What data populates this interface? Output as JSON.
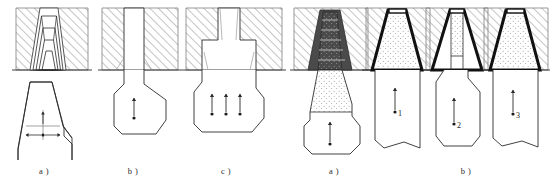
{
  "groups": [
    {
      "name": "left-group",
      "figures": [
        {
          "id": "left-a",
          "caption": "a )",
          "caption_x": 44,
          "caption_y": 172,
          "description": "stepped nested trapezoidal die cavity with hatched die body and billet below carrying crosshair dimension marker",
          "die_type": "stepped-cavity",
          "cavity_steps": 5,
          "fill": "none",
          "outline_weight": "thin",
          "arrows": [
            {
              "name": "vertical-dimension-arrow",
              "direction": "up",
              "label": ""
            },
            {
              "name": "horizontal-dimension-arrow-left",
              "direction": "left",
              "label": ""
            },
            {
              "name": "horizontal-dimension-arrow-right",
              "direction": "right",
              "label": ""
            }
          ],
          "marker": "crosshair"
        },
        {
          "id": "left-b",
          "caption": "b )",
          "caption_x": 133,
          "caption_y": 172,
          "description": "straight parallel die channel with hatched die body and flared billet below with single upward arrow",
          "die_type": "straight-channel",
          "cavity_steps": 0,
          "fill": "none",
          "outline_weight": "thin",
          "arrows": [
            {
              "name": "flow-arrow",
              "direction": "up",
              "label": ""
            }
          ],
          "marker": "dot"
        },
        {
          "id": "left-c",
          "caption": "c )",
          "caption_x": 226,
          "caption_y": 172,
          "description": "stepped shoulder die with hatched body and wide billet below with three upward flow arrows",
          "die_type": "stepped-shoulder",
          "cavity_steps": 2,
          "fill": "none",
          "outline_weight": "thin",
          "arrows": [
            {
              "name": "flow-arrow-left",
              "direction": "up",
              "label": ""
            },
            {
              "name": "flow-arrow-center",
              "direction": "up",
              "label": ""
            },
            {
              "name": "flow-arrow-right",
              "direction": "up",
              "label": ""
            }
          ],
          "marker": "dot"
        }
      ]
    },
    {
      "name": "right-group",
      "figures": [
        {
          "id": "right-a",
          "caption": "a )",
          "caption_x": 334,
          "caption_y": 172,
          "description": "stepped conical die cavity with dark step shading and stippled dead-metal zone, billet below with upward arrow",
          "die_type": "stepped-conical",
          "cavity_steps": 6,
          "fill": "stipple",
          "outline_weight": "thin",
          "arrows": [
            {
              "name": "flow-arrow",
              "direction": "up",
              "label": ""
            }
          ],
          "marker": "dot"
        },
        {
          "id": "right-b1",
          "caption": "",
          "caption_x": 0,
          "caption_y": 0,
          "description": "smooth conical die with heavy black wall, stippled deformation zone, billet below labelled 1",
          "die_type": "conical-smooth",
          "cavity_steps": 0,
          "fill": "stipple",
          "outline_weight": "heavy",
          "arrows": [
            {
              "name": "flow-arrow",
              "direction": "up",
              "label": "1"
            }
          ],
          "marker": "dot",
          "number_label": "1"
        },
        {
          "id": "right-b2",
          "caption": "",
          "caption_x": 0,
          "caption_y": 0,
          "description": "narrow funnel die with heavy black walls, stippled zone, billet below labelled 2",
          "die_type": "funnel-narrow",
          "cavity_steps": 0,
          "fill": "stipple",
          "outline_weight": "heavy",
          "arrows": [
            {
              "name": "flow-arrow",
              "direction": "up",
              "label": "2"
            }
          ],
          "marker": "dot",
          "number_label": "2"
        },
        {
          "id": "right-b3",
          "caption": "b )",
          "caption_x": 466,
          "caption_y": 172,
          "description": "wide conical die with heavy black walls, stippled zone, billet below labelled 3",
          "die_type": "conical-wide",
          "cavity_steps": 0,
          "fill": "stipple",
          "outline_weight": "heavy",
          "arrows": [
            {
              "name": "flow-arrow",
              "direction": "up",
              "label": "3"
            }
          ],
          "marker": "dot",
          "number_label": "3"
        }
      ]
    }
  ],
  "labels": {
    "num1": "1",
    "num2": "2",
    "num3": "3",
    "cap_left_a": "a )",
    "cap_left_b": "b )",
    "cap_left_c": "c )",
    "cap_right_a": "a )",
    "cap_right_b": "b )"
  },
  "colors": {
    "line": "#2b2b2b",
    "hatch": "#8c8c8c",
    "heavy": "#111111",
    "stipple": "#9a9a9a",
    "background": "#ffffff"
  }
}
